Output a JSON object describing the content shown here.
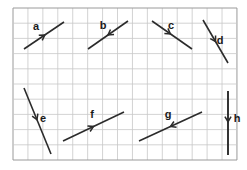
{
  "figure": {
    "type": "vector-diagram",
    "background_color": "#ffffff",
    "grid": {
      "x": 13,
      "y": 8,
      "width": 224,
      "height": 152,
      "columns": 15,
      "rows": 10,
      "cell_width": 14.93,
      "cell_height": 15.2,
      "line_color": "#c8c8c8",
      "border_color": "#9a9a9a",
      "show_grid": true
    },
    "stroke_color": "#2b2b2b",
    "label_color": "#1a1a1a",
    "vectors": [
      {
        "id": "a",
        "label": "a",
        "x1": 24,
        "y1": 49,
        "x2": 64,
        "y2": 22,
        "arrow_t": 0.52,
        "arrow_direction": "forward",
        "label_x": 36,
        "label_y": 30,
        "stroke_width": 1.6
      },
      {
        "id": "b",
        "label": "b",
        "x1": 88,
        "y1": 49,
        "x2": 128,
        "y2": 21,
        "arrow_t": 0.5,
        "arrow_direction": "reverse",
        "label_x": 103,
        "label_y": 29,
        "stroke_width": 1.6
      },
      {
        "id": "c",
        "label": "c",
        "x1": 152,
        "y1": 21,
        "x2": 192,
        "y2": 49,
        "arrow_t": 0.46,
        "arrow_direction": "forward",
        "label_x": 171,
        "label_y": 29,
        "stroke_width": 1.6
      },
      {
        "id": "d",
        "label": "d",
        "x1": 203,
        "y1": 20,
        "x2": 228,
        "y2": 63,
        "arrow_t": 0.5,
        "arrow_direction": "forward",
        "label_x": 220,
        "label_y": 44,
        "stroke_width": 1.6
      },
      {
        "id": "e",
        "label": "e",
        "x1": 24,
        "y1": 88,
        "x2": 51,
        "y2": 154,
        "arrow_t": 0.48,
        "arrow_direction": "forward",
        "label_x": 43,
        "label_y": 122,
        "stroke_width": 1.6
      },
      {
        "id": "f",
        "label": "f",
        "x1": 63,
        "y1": 141,
        "x2": 124,
        "y2": 112,
        "arrow_t": 0.5,
        "arrow_direction": "reverse_head_forward",
        "label_x": 92,
        "label_y": 118,
        "stroke_width": 1.6
      },
      {
        "id": "g",
        "label": "g",
        "x1": 139,
        "y1": 141,
        "x2": 202,
        "y2": 112,
        "arrow_t": 0.5,
        "arrow_direction": "reverse",
        "label_x": 168,
        "label_y": 118,
        "stroke_width": 1.6
      },
      {
        "id": "h",
        "label": "h",
        "x1": 228,
        "y1": 91,
        "x2": 228,
        "y2": 155,
        "arrow_t": 0.48,
        "arrow_direction": "forward",
        "label_x": 237,
        "label_y": 122,
        "stroke_width": 1.9
      }
    ]
  }
}
